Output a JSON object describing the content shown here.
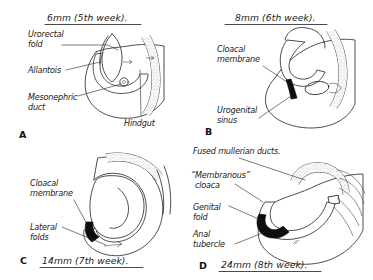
{
  "figure": {
    "background_color": "#ffffff",
    "ink_color": "#1a1a1a",
    "membrane_color": "#0d0d0d",
    "panel_count": 4
  },
  "panels": [
    {
      "letter": "A",
      "caption": "6mm (5th week).",
      "size": "6mm",
      "week": "5th week",
      "labels": [
        {
          "id": "urorectal-fold",
          "text_line_1": "Urorectal",
          "text_line_2": "fold"
        },
        {
          "id": "allantois",
          "text_line_1": "Allantois",
          "text_line_2": ""
        },
        {
          "id": "mesonephric-duct",
          "text_line_1": "Mesonephric",
          "text_line_2": "duct"
        },
        {
          "id": "hindgut",
          "text_line_1": "Hindgut",
          "text_line_2": ""
        }
      ]
    },
    {
      "letter": "B",
      "caption": "8mm (6th week).",
      "size": "8mm",
      "week": "6th week",
      "labels": [
        {
          "id": "cloacal-membrane",
          "text_line_1": "Cloacal",
          "text_line_2": "membrane"
        },
        {
          "id": "urogenital-sinus",
          "text_line_1": "Urogenital",
          "text_line_2": "sinus"
        }
      ]
    },
    {
      "letter": "C",
      "caption": "14mm (7th week).",
      "size": "14mm",
      "week": "7th week",
      "labels": [
        {
          "id": "cloacal-membrane",
          "text_line_1": "Cloacal",
          "text_line_2": "membrane"
        },
        {
          "id": "lateral-folds",
          "text_line_1": "Lateral",
          "text_line_2": "folds"
        }
      ]
    },
    {
      "letter": "D",
      "caption": "24mm (8th week).",
      "size": "24mm",
      "week": "8th week",
      "labels": [
        {
          "id": "fused-mullerian-ducts",
          "text_line_1": "Fused mullerian ducts.",
          "text_line_2": ""
        },
        {
          "id": "membranous-cloaca",
          "text_line_1": "“Membranous”",
          "text_line_2": "cloaca"
        },
        {
          "id": "genital-fold",
          "text_line_1": "Genital",
          "text_line_2": "fold"
        },
        {
          "id": "anal-tubercle",
          "text_line_1": "Anal",
          "text_line_2": "tubercle"
        }
      ]
    }
  ]
}
